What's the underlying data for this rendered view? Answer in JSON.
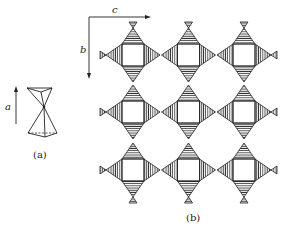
{
  "figure": {
    "panel_a": {
      "caption": "(a)",
      "axis_label": "a",
      "description": "Two corner-sharing tetrahedra"
    },
    "panel_b": {
      "caption": "(b)",
      "axis_labels": {
        "horizontal": "c",
        "vertical": "b"
      },
      "grid": {
        "rows": 3,
        "cols": 3
      },
      "description": "Framework of corner-linked tetrahedra surrounding square cavities"
    }
  },
  "colors": {
    "ink": "#222222",
    "hatch_dark": "#444444",
    "background": "#ffffff"
  }
}
